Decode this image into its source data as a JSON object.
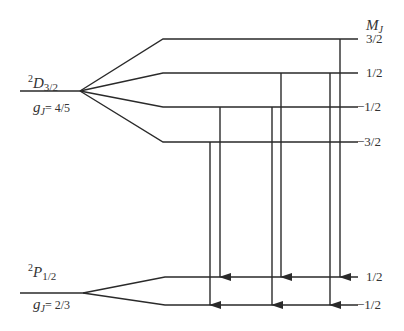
{
  "upper_state": {
    "term": "D",
    "multiplicity": "2",
    "j": "3/2",
    "g_label": "g",
    "g_sub": "J",
    "g_value": "= 4/5",
    "sublevels": [
      {
        "mj": "3/2",
        "y": 39
      },
      {
        "mj": "1/2",
        "y": 73
      },
      {
        "mj": "−1/2",
        "y": 107
      },
      {
        "mj": "−3/2",
        "y": 142
      }
    ]
  },
  "lower_state": {
    "term": "P",
    "multiplicity": "2",
    "j": "1/2",
    "g_label": "g",
    "g_sub": "J",
    "g_value": "= 2/3",
    "sublevels": [
      {
        "mj": "1/2",
        "y": 277
      },
      {
        "mj": "−1/2",
        "y": 305
      }
    ]
  },
  "mj_header": {
    "label": "M",
    "sub": "J"
  },
  "transitions": [
    {
      "from": "−3/2",
      "to": "−1/2",
      "x": 210
    },
    {
      "from": "−1/2",
      "to": "1/2",
      "x": 220
    },
    {
      "from": "−1/2",
      "to": "−1/2",
      "x": 272
    },
    {
      "from": "1/2",
      "to": "1/2",
      "x": 281
    },
    {
      "from": "1/2",
      "to": "−1/2",
      "x": 330
    },
    {
      "from": "3/2",
      "to": "1/2",
      "x": 340
    }
  ],
  "colors": {
    "line": "#2a2a2a"
  }
}
